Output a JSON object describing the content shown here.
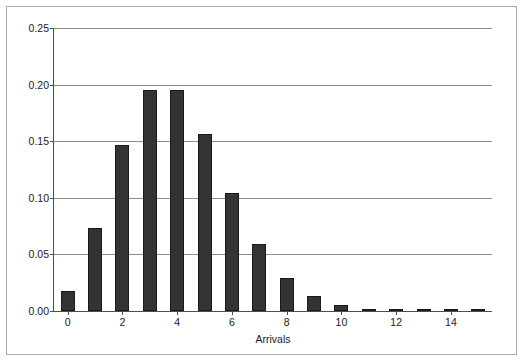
{
  "chart_data": {
    "type": "bar",
    "title": "",
    "xlabel": "Arrivals",
    "ylabel": "",
    "categories": [
      0,
      1,
      2,
      3,
      4,
      5,
      6,
      7,
      8,
      9,
      10,
      11,
      12,
      13,
      14,
      15
    ],
    "values": [
      0.018,
      0.073,
      0.147,
      0.195,
      0.195,
      0.156,
      0.104,
      0.059,
      0.029,
      0.013,
      0.005,
      0.002,
      0.0006,
      0.0002,
      5e-05,
      2e-05
    ],
    "ylim": [
      0.0,
      0.25
    ],
    "xlim": [
      -0.5,
      15.5
    ],
    "y_ticks": [
      0.0,
      0.05,
      0.1,
      0.15,
      0.2,
      0.25
    ],
    "y_tick_labels": [
      "0.00",
      "0.05",
      "0.10",
      "0.15",
      "0.20",
      "0.25"
    ],
    "x_ticks": [
      0,
      2,
      4,
      6,
      8,
      10,
      12,
      14
    ],
    "x_tick_labels": [
      "0",
      "2",
      "4",
      "6",
      "8",
      "10",
      "12",
      "14"
    ],
    "grid": true,
    "grid_axis": "y",
    "legend": false,
    "bar_color": "#333333",
    "grid_color": "#8c8c8c",
    "axis_color": "#4d4d4d",
    "frame_color": "#a8a8a8",
    "background": "#ffffff"
  }
}
